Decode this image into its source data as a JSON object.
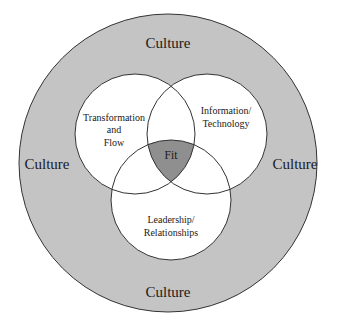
{
  "diagram": {
    "type": "venn",
    "outer": {
      "label": "Culture",
      "fill": "#c4c4c4",
      "stroke": "#333333"
    },
    "culture_labels": {
      "top": "Culture",
      "left": "Culture",
      "right": "Culture",
      "bottom": "Culture"
    },
    "circles": [
      {
        "id": "transformation",
        "lines": [
          "Transformation",
          "and",
          "Flow"
        ],
        "fill": "#ffffff"
      },
      {
        "id": "information",
        "lines": [
          "Information/",
          "Technology"
        ],
        "fill": "#ffffff"
      },
      {
        "id": "leadership",
        "lines": [
          "Leadership/",
          "Relationships"
        ],
        "fill": "#ffffff"
      }
    ],
    "center": {
      "label": "Fit",
      "fill": "#8f8f8f"
    }
  }
}
